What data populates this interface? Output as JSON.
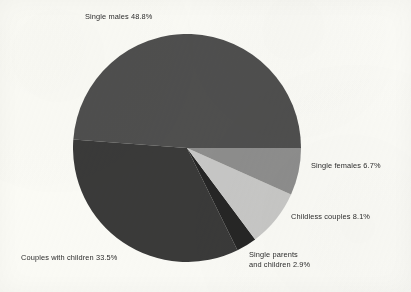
{
  "background_color": "#fbfbf8",
  "text_color": "#2b2b2b",
  "chart_data": {
    "type": "pie",
    "title": "",
    "subtitle": "",
    "xlabel": "",
    "ylabel": "",
    "legend_position": "none",
    "labels_position": "outside-callout",
    "grid": false,
    "units": "percent",
    "total": 100.0,
    "categories": [
      "Single males",
      "Couples with children",
      "Single parents and children",
      "Childless couples",
      "Single females"
    ],
    "values": [
      48.8,
      33.5,
      2.9,
      8.1,
      6.7
    ],
    "colors": [
      "#4f4f4f",
      "#3a3a3a",
      "#262626",
      "#c8c8c8",
      "#8e8e8e"
    ],
    "slices": [
      {
        "name": "single-males",
        "category": "Single males",
        "value": 48.8,
        "value_text": "48.8%",
        "label_text": "Single males 48.8%",
        "color": "#4f4f4f",
        "start_angle": 0.0,
        "end_angle": 175.68
      },
      {
        "name": "couples-with-children",
        "category": "Couples with children",
        "value": 33.5,
        "value_text": "33.5%",
        "label_text": "Couples with children 33.5%",
        "color": "#3a3a3a",
        "start_angle": 175.68,
        "end_angle": 296.28
      },
      {
        "name": "single-parents-and-children",
        "category": "Single parents and children",
        "value": 2.9,
        "value_text": "2.9%",
        "label_text": "Single parents and children 2.9%",
        "color": "#262626",
        "start_angle": 296.28,
        "end_angle": 306.72
      },
      {
        "name": "childless-couples",
        "category": "Childless couples",
        "value": 8.1,
        "value_text": "8.1%",
        "label_text": "Childless couples 8.1%",
        "color": "#c8c8c8",
        "start_angle": 306.72,
        "end_angle": 335.88
      },
      {
        "name": "single-females",
        "category": "Single females",
        "value": 6.7,
        "value_text": "6.7%",
        "label_text": "Single females 6.7%",
        "color": "#8e8e8e",
        "start_angle": 335.88,
        "end_angle": 360.0
      }
    ]
  },
  "labels": {
    "single_males": "Single males 48.8%",
    "single_females": "Single females 6.7%",
    "childless_couples": "Childless couples 8.1%",
    "single_parents_line1": "Single parents",
    "single_parents_line2": "and children 2.9%",
    "couples_with_children": "Couples with children 33.5%"
  }
}
